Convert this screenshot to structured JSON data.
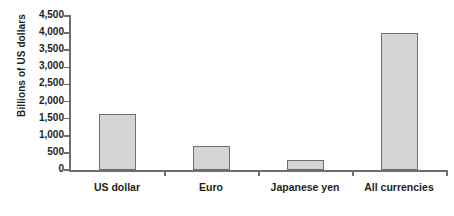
{
  "chart_data": {
    "type": "bar",
    "title": "",
    "subtitle": "",
    "xlabel": "",
    "ylabel": "Billions of US dollars",
    "categories": [
      "US dollar",
      "Euro",
      "Japanese yen",
      "All currencies"
    ],
    "values": [
      1650,
      700,
      300,
      4000
    ],
    "series": [
      {
        "name": "Amount outstanding",
        "values": [
          1650,
          700,
          300,
          4000
        ]
      }
    ],
    "ylim": [
      0,
      4500
    ],
    "y_ticks": [
      0,
      500,
      1000,
      1500,
      2000,
      2500,
      3000,
      3500,
      4000,
      4500
    ],
    "y_tick_labels": [
      "0",
      "500",
      "1,000",
      "1,500",
      "2,000",
      "2,500",
      "3,000",
      "3,500",
      "4,000",
      "4,500"
    ],
    "grid": false,
    "legend": null,
    "legend_position": "none",
    "bar_fill_color": "#d4d5d6",
    "bar_border_color": "#6d6e71",
    "axis_color": "#6d6e71",
    "text_color": "#231f20",
    "background_color": "#ffffff"
  }
}
